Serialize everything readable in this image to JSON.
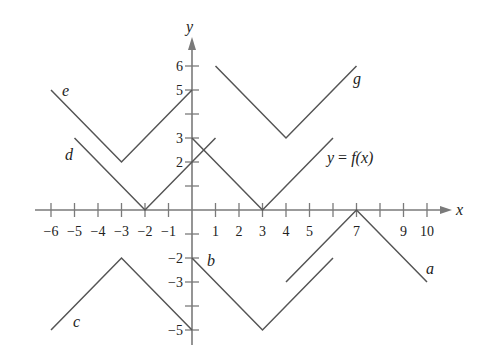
{
  "figure": {
    "axes": {
      "x_label": "x",
      "y_label": "y",
      "origin_px": [
        192,
        210
      ],
      "unit_px": [
        23.5,
        24
      ],
      "x_ticks": [
        -6,
        -5,
        -4,
        -3,
        -2,
        -1,
        1,
        2,
        3,
        4,
        5,
        6,
        7,
        8,
        9,
        10
      ],
      "x_tick_labels": [
        {
          "value": -6,
          "text": "−6"
        },
        {
          "value": -5,
          "text": "−5"
        },
        {
          "value": -4,
          "text": "−4"
        },
        {
          "value": -3,
          "text": "−3"
        },
        {
          "value": -2,
          "text": "−2"
        },
        {
          "value": -1,
          "text": "−1"
        },
        {
          "value": 1,
          "text": "1"
        },
        {
          "value": 2,
          "text": "2"
        },
        {
          "value": 3,
          "text": "3"
        },
        {
          "value": 4,
          "text": "4"
        },
        {
          "value": 5,
          "text": "5"
        },
        {
          "value": 7,
          "text": "7"
        },
        {
          "value": 9,
          "text": "9"
        },
        {
          "value": 10,
          "text": "10"
        }
      ],
      "y_ticks": [
        6,
        5,
        4,
        3,
        2,
        1,
        -1,
        -2,
        -3,
        -4,
        -5
      ],
      "y_tick_labels": [
        {
          "value": 6,
          "text": "6"
        },
        {
          "value": 5,
          "text": "5"
        },
        {
          "value": 3,
          "text": "3"
        },
        {
          "value": 2,
          "text": "2"
        },
        {
          "value": -2,
          "text": "−2"
        },
        {
          "value": -3,
          "text": "−3"
        },
        {
          "value": -5,
          "text": "−5"
        }
      ]
    },
    "curves": [
      {
        "name": "f",
        "label": "y = f(x)",
        "points": [
          [
            0,
            3
          ],
          [
            3,
            0
          ],
          [
            6,
            3
          ]
        ]
      },
      {
        "name": "g",
        "label": "g",
        "points": [
          [
            1,
            6
          ],
          [
            4,
            3
          ],
          [
            7,
            6
          ]
        ]
      },
      {
        "name": "e",
        "label": "e",
        "points": [
          [
            -6,
            5
          ],
          [
            -3,
            2
          ],
          [
            0,
            5
          ]
        ]
      },
      {
        "name": "d",
        "label": "d",
        "points": [
          [
            -5,
            3
          ],
          [
            -2,
            0
          ],
          [
            1,
            3
          ]
        ]
      },
      {
        "name": "c",
        "label": "c",
        "points": [
          [
            -6,
            -5
          ],
          [
            -3,
            -2
          ],
          [
            0,
            -5
          ]
        ]
      },
      {
        "name": "b",
        "label": "b",
        "points": [
          [
            0,
            -2
          ],
          [
            3,
            -5
          ],
          [
            6,
            -2
          ]
        ]
      },
      {
        "name": "a",
        "label": "a",
        "points": [
          [
            4,
            -3
          ],
          [
            7,
            0
          ],
          [
            10,
            -3
          ]
        ]
      }
    ],
    "labels": {
      "f_eq": {
        "y": "y",
        "eq": " = ",
        "f": "f",
        "arg": "(x)"
      },
      "g": "g",
      "e": "e",
      "d": "d",
      "c": "c",
      "b": "b",
      "a": "a",
      "x_axis": "x",
      "y_axis": "y"
    },
    "colors": {
      "axis": "#7a7a7a",
      "curve": "#555555",
      "text": "#222222",
      "background": "#ffffff"
    }
  }
}
